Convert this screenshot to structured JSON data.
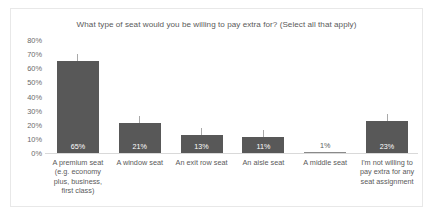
{
  "chart_data": {
    "type": "bar",
    "title": "What type of seat would you be willing to pay extra for? (Select all that apply)",
    "xlabel": "",
    "ylabel": "",
    "ylim": [
      0,
      80
    ],
    "grid": false,
    "legend": null,
    "error_bars": true,
    "bar_color": "#585858",
    "categories": [
      "A premium seat (e.g. economy plus, business, first class)",
      "A window seat",
      "An exit row seat",
      "An aisle seat",
      "A middle seat",
      "I'm not willing to pay extra for any seat assignment"
    ],
    "category_lines": [
      [
        "A premium seat",
        "(e.g. economy",
        "plus, business,",
        "first class)"
      ],
      [
        "A window seat"
      ],
      [
        "An exit row seat"
      ],
      [
        "An aisle seat"
      ],
      [
        "A middle seat"
      ],
      [
        "I'm not willing to",
        "pay extra for any",
        "seat assignment"
      ]
    ],
    "values": [
      65,
      21,
      13,
      11,
      1,
      23
    ],
    "data_labels": [
      "65%",
      "21%",
      "13%",
      "11%",
      "1%",
      "23%"
    ],
    "y_ticks": [
      80,
      70,
      60,
      50,
      40,
      30,
      20,
      10,
      0
    ],
    "y_tick_labels": [
      "80%",
      "70%",
      "60%",
      "50%",
      "40%",
      "30%",
      "20%",
      "10%",
      "0%"
    ]
  }
}
